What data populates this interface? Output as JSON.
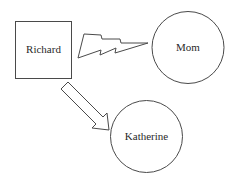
{
  "diagram": {
    "nodes": [
      {
        "id": "richard",
        "label": "Richard",
        "shape": "square"
      },
      {
        "id": "mom",
        "label": "Mom",
        "shape": "circle"
      },
      {
        "id": "katherine",
        "label": "Katherine",
        "shape": "circle"
      }
    ],
    "edges": [
      {
        "from": "richard",
        "to": "mom",
        "style": "lightning-bolt",
        "meaning": "conflict"
      },
      {
        "from": "richard",
        "to": "katherine",
        "style": "hollow-arrow"
      }
    ],
    "colors": {
      "stroke": "#4a4a4a",
      "text": "#2a2a2a",
      "background": "#ffffff"
    }
  }
}
